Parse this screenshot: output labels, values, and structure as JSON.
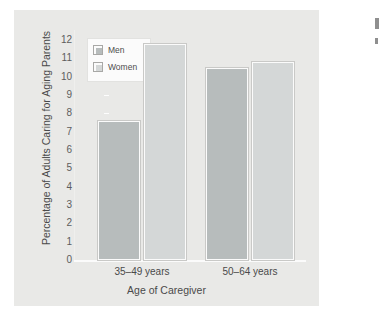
{
  "chart_data": {
    "type": "bar",
    "title": "",
    "subtitle": "",
    "xlabel": "Age of Caregiver",
    "ylabel": "Percentage of Adults Caring for Aging Parents",
    "categories": [
      "35–49 years",
      "50–64 years"
    ],
    "series": [
      {
        "name": "Men",
        "values": [
          7.6,
          10.5
        ],
        "color": "#b7bcbc"
      },
      {
        "name": "Women",
        "values": [
          11.8,
          10.8
        ],
        "color": "#d4d7d7"
      }
    ],
    "ylim": [
      0,
      12
    ],
    "yticks": [
      12,
      11,
      10,
      9,
      8,
      7,
      6,
      5,
      4,
      3,
      2,
      1,
      0
    ],
    "grid": false,
    "legend_position": "top-left",
    "legend_entries": [
      "Men",
      "Women"
    ]
  },
  "figure": {
    "panel_background": "#e9e9e7",
    "page_background": "#ffffff",
    "axis_color": "#fbfbfb",
    "text_color": "#4a4a4a"
  },
  "edge_marks": [
    "mark-upper",
    "mark-lower"
  ]
}
